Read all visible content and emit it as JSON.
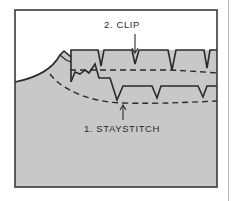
{
  "figure": {
    "type": "sewing-instruction-diagram",
    "colors": {
      "fabric": "#c8c8c8",
      "background": "#ffffff",
      "line": "#2a2a2a",
      "frame": "#3a3a3a"
    },
    "callouts": [
      {
        "id": "clip",
        "text": "2. CLIP",
        "x": 122,
        "y": 19
      },
      {
        "id": "staystitch",
        "text": "1. STAYSTITCH",
        "x": 122,
        "y": 123
      }
    ]
  }
}
